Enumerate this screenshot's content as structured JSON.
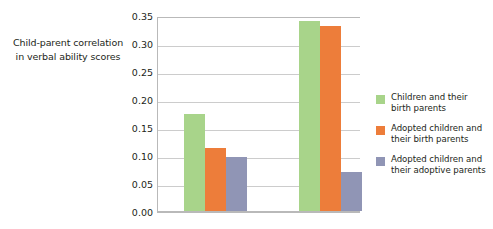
{
  "chart_data": {
    "type": "bar",
    "title": "",
    "xlabel": "",
    "ylabel_lines": [
      "Child-parent correlation",
      "in verbal ability scores"
    ],
    "ylabel": "Child-parent correlation in verbal ability scores",
    "ylim": [
      0.0,
      0.35
    ],
    "yticks": [
      "0.35",
      "0.30",
      "0.25",
      "0.20",
      "0.15",
      "0.10",
      "0.05",
      "0.00"
    ],
    "ytick_values": [
      0.35,
      0.3,
      0.25,
      0.2,
      0.15,
      0.1,
      0.05,
      0.0
    ],
    "grid": true,
    "legend_position": "right",
    "categories": [
      "",
      ""
    ],
    "series": [
      {
        "name": "Children and their birth parents",
        "name_lines": [
          "Children and their",
          "birth parents"
        ],
        "color": "#a8d48a",
        "values": [
          0.173,
          0.34
        ]
      },
      {
        "name": "Adopted children and their birth parents",
        "name_lines": [
          "Adopted children and",
          "their birth parents"
        ],
        "color": "#ed7d3a",
        "values": [
          0.112,
          0.331
        ]
      },
      {
        "name": "Adopted children and their adoptive parents",
        "name_lines": [
          "Adopted children and",
          "their adoptive parents"
        ],
        "color": "#9095b5",
        "values": [
          0.097,
          0.07
        ]
      }
    ]
  }
}
